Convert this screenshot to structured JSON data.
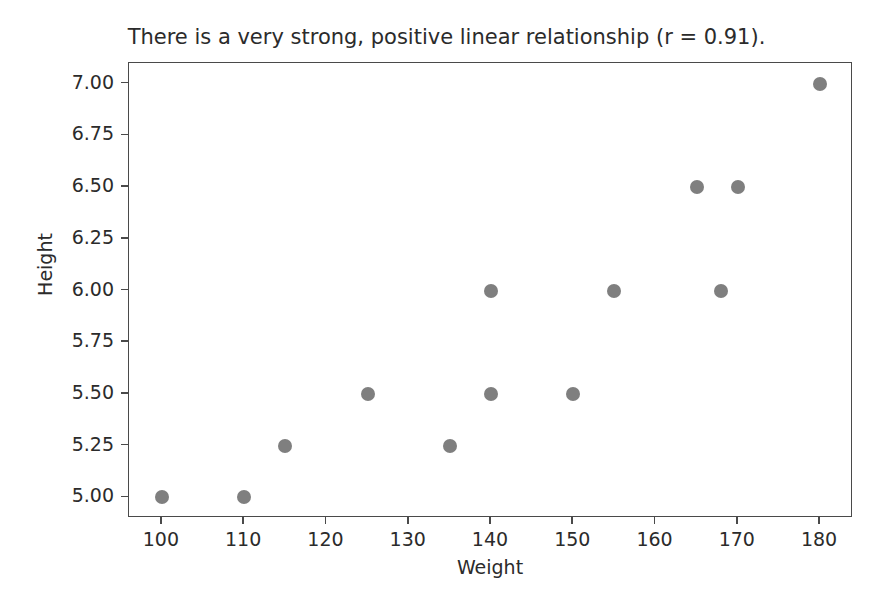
{
  "chart_data": {
    "type": "scatter",
    "title": "There is a very strong, positive linear relationship (r = 0.91).",
    "xlabel": "Weight",
    "ylabel": "Height",
    "xlim": [
      96,
      184
    ],
    "ylim": [
      4.9,
      7.1
    ],
    "xticks": [
      100,
      110,
      120,
      130,
      140,
      150,
      160,
      170,
      180
    ],
    "xtick_labels": [
      "100",
      "110",
      "120",
      "130",
      "140",
      "150",
      "160",
      "170",
      "180"
    ],
    "yticks": [
      5.0,
      5.25,
      5.5,
      5.75,
      6.0,
      6.25,
      6.5,
      6.75,
      7.0
    ],
    "ytick_labels": [
      "5.00",
      "5.25",
      "5.50",
      "5.75",
      "6.00",
      "6.25",
      "6.50",
      "6.75",
      "7.00"
    ],
    "grid": false,
    "legend": null,
    "marker_color": "#7f7f7f",
    "marker_size": 14,
    "correlation": 0.91,
    "points": [
      {
        "x": 100,
        "y": 5.0
      },
      {
        "x": 110,
        "y": 5.0
      },
      {
        "x": 115,
        "y": 5.25
      },
      {
        "x": 125,
        "y": 5.5
      },
      {
        "x": 135,
        "y": 5.25
      },
      {
        "x": 140,
        "y": 5.5
      },
      {
        "x": 140,
        "y": 6.0
      },
      {
        "x": 150,
        "y": 5.5
      },
      {
        "x": 155,
        "y": 6.0
      },
      {
        "x": 165,
        "y": 6.5
      },
      {
        "x": 168,
        "y": 6.0
      },
      {
        "x": 170,
        "y": 6.5
      },
      {
        "x": 180,
        "y": 7.0
      }
    ],
    "series": [
      {
        "name": "Height vs Weight",
        "x": [
          100,
          110,
          115,
          125,
          135,
          140,
          140,
          150,
          155,
          165,
          168,
          170,
          180
        ],
        "values": [
          5.0,
          5.0,
          5.25,
          5.5,
          5.25,
          5.5,
          6.0,
          5.5,
          6.0,
          6.5,
          6.0,
          6.5,
          7.0
        ]
      }
    ]
  }
}
